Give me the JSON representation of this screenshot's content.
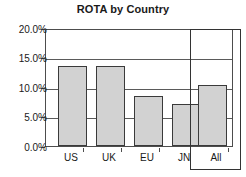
{
  "chart_data": {
    "type": "bar",
    "title": "ROTA by Country",
    "xlabel": "",
    "ylabel": "",
    "categories": [
      "US",
      "UK",
      "EU",
      "JN",
      "All"
    ],
    "values": [
      13.8,
      13.8,
      8.7,
      7.2,
      10.5
    ],
    "ylim": [
      0.0,
      20.0
    ],
    "ytick_values": [
      0.0,
      5.0,
      10.0,
      15.0,
      20.0
    ],
    "ytick_labels": [
      "0.0%",
      "5.0%",
      "10.0%",
      "15.0%",
      "20.0%"
    ],
    "grid": true,
    "legend": false,
    "value_format": "percent",
    "bar_fill_color": "#d2d2d2",
    "bar_border_color": "#3a3a3a",
    "highlight": {
      "category": "All",
      "border_color": "#333333"
    }
  }
}
